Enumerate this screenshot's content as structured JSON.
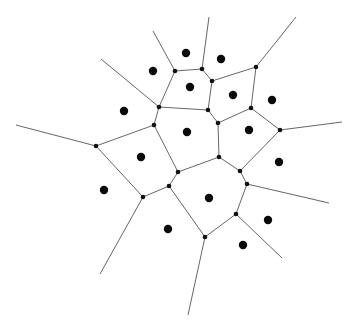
{
  "diagram": {
    "type": "voronoi",
    "width": 351,
    "height": 328,
    "colors": {
      "background": "#ffffff",
      "edge": "#555555",
      "vertex": "#111111",
      "site": "#0a0a0a"
    },
    "vertex_radius": 2.3,
    "site_radius": 4.2,
    "vertices": {
      "V1": [
        175,
        71
      ],
      "V2": [
        202,
        69
      ],
      "V3": [
        212,
        81
      ],
      "V4": [
        256,
        67
      ],
      "V5": [
        159,
        107
      ],
      "V6": [
        208,
        110
      ],
      "V7": [
        251,
        108
      ],
      "V8": [
        154,
        125
      ],
      "V9": [
        218,
        123
      ],
      "V10": [
        280,
        130
      ],
      "V11": [
        96,
        146
      ],
      "V12": [
        219,
        157
      ],
      "V13": [
        178,
        172
      ],
      "V14": [
        240,
        171
      ],
      "V15": [
        247,
        184
      ],
      "V16": [
        169,
        186
      ],
      "V17": [
        143,
        197
      ],
      "V18": [
        236,
        214
      ],
      "V19": [
        205,
        237
      ]
    },
    "edges": [
      [
        "V1",
        "V2"
      ],
      [
        "V2",
        "V3"
      ],
      [
        "V3",
        "V4"
      ],
      [
        "V1",
        "V5"
      ],
      [
        "V3",
        "V6"
      ],
      [
        "V4",
        "V7"
      ],
      [
        "V5",
        "V6"
      ],
      [
        "V5",
        "V8"
      ],
      [
        "V6",
        "V9"
      ],
      [
        "V9",
        "V7"
      ],
      [
        "V7",
        "V10"
      ],
      [
        "V8",
        "V11"
      ],
      [
        "V8",
        "V13"
      ],
      [
        "V9",
        "V12"
      ],
      [
        "V12",
        "V13"
      ],
      [
        "V12",
        "V14"
      ],
      [
        "V10",
        "V14"
      ],
      [
        "V14",
        "V15"
      ],
      [
        "V15",
        "V18"
      ],
      [
        "V11",
        "V17"
      ],
      [
        "V17",
        "V16"
      ],
      [
        "V16",
        "V13"
      ],
      [
        "V16",
        "V19"
      ],
      [
        "V18",
        "V19"
      ]
    ],
    "rays": [
      {
        "from": "V1",
        "to": [
          153,
          31
        ]
      },
      {
        "from": "V2",
        "to": [
          209,
          17
        ]
      },
      {
        "from": "V4",
        "to": [
          296,
          17
        ]
      },
      {
        "from": "V5",
        "to": [
          101,
          59
        ]
      },
      {
        "from": "V11",
        "to": [
          16,
          125
        ]
      },
      {
        "from": "V10",
        "to": [
          342,
          122
        ]
      },
      {
        "from": "V15",
        "to": [
          329,
          203
        ]
      },
      {
        "from": "V18",
        "to": [
          282,
          258
        ]
      },
      {
        "from": "V19",
        "to": [
          188,
          315
        ]
      },
      {
        "from": "V17",
        "to": [
          100,
          274
        ]
      }
    ],
    "sites": [
      [
        186,
        53
      ],
      [
        221,
        59
      ],
      [
        153,
        71
      ],
      [
        190,
        87
      ],
      [
        233,
        95
      ],
      [
        272,
        100
      ],
      [
        124,
        111
      ],
      [
        187,
        132
      ],
      [
        249,
        130
      ],
      [
        141,
        157
      ],
      [
        279,
        162
      ],
      [
        104,
        190
      ],
      [
        209,
        198
      ],
      [
        268,
        220
      ],
      [
        168,
        229
      ],
      [
        243,
        245
      ]
    ]
  }
}
